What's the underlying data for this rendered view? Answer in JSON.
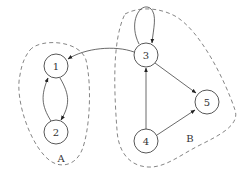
{
  "diagram": {
    "type": "directed-graph",
    "nodes": [
      {
        "id": "1",
        "label": "1",
        "x": 56,
        "y": 66
      },
      {
        "id": "2",
        "label": "2",
        "x": 56,
        "y": 132
      },
      {
        "id": "3",
        "label": "3",
        "x": 146,
        "y": 55
      },
      {
        "id": "4",
        "label": "4",
        "x": 146,
        "y": 141
      },
      {
        "id": "5",
        "label": "5",
        "x": 207,
        "y": 102
      }
    ],
    "edges": [
      {
        "from": "1",
        "to": "2"
      },
      {
        "from": "2",
        "to": "1"
      },
      {
        "from": "3",
        "to": "1"
      },
      {
        "from": "3",
        "to": "3"
      },
      {
        "from": "3",
        "to": "5"
      },
      {
        "from": "4",
        "to": "3"
      },
      {
        "from": "4",
        "to": "5"
      }
    ],
    "groups": [
      {
        "id": "A",
        "label": "A",
        "members": [
          "1",
          "2"
        ]
      },
      {
        "id": "B",
        "label": "B",
        "members": [
          "3",
          "4",
          "5"
        ]
      }
    ]
  }
}
